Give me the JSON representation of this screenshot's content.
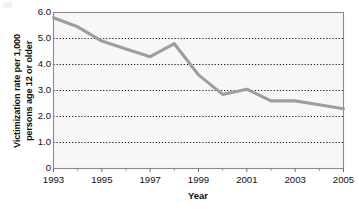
{
  "chart_data": {
    "type": "line",
    "title": "",
    "xlabel": "Year",
    "ylabel_line1": "Victimization rate per 1,000",
    "ylabel_line2": "persons age 12 or older",
    "x": [
      1993,
      1994,
      1995,
      1996,
      1997,
      1998,
      1999,
      2000,
      2001,
      2002,
      2003,
      2004,
      2005
    ],
    "values": [
      5.8,
      5.45,
      4.9,
      4.6,
      4.3,
      4.8,
      3.6,
      2.85,
      3.05,
      2.6,
      2.6,
      2.45,
      2.3
    ],
    "series": [
      {
        "name": "Victimization rate",
        "color": "#9e9e9e",
        "values": [
          5.8,
          5.45,
          4.9,
          4.6,
          4.3,
          4.8,
          3.6,
          2.85,
          3.05,
          2.6,
          2.6,
          2.45,
          2.3
        ]
      }
    ],
    "xlim": [
      1993,
      2005
    ],
    "ylim": [
      0,
      6
    ],
    "xticks": [
      1993,
      1995,
      1997,
      1999,
      2001,
      2003,
      2005
    ],
    "xtick_labels": [
      "1993",
      "1995",
      "1997",
      "1999",
      "2001",
      "2003",
      "2005"
    ],
    "xminor_ticks": [
      1994,
      1996,
      1998,
      2000,
      2002,
      2004
    ],
    "yticks": [
      0,
      1,
      2,
      3,
      4,
      5,
      6
    ],
    "ytick_labels": [
      "0",
      "1.0",
      "2.0",
      "3.0",
      "4.0",
      "5.0",
      "6.0"
    ],
    "grid": true,
    "grid_style": "dotted",
    "grid_color": "#1a1a1a",
    "legend": "none",
    "plot_background": "#f7f7f7",
    "axis_color": "#8c8c8c"
  },
  "axis": {
    "xlabel": "Year",
    "ylabel_line1": "Victimization rate per 1,000",
    "ylabel_line2": "persons age 12 or older"
  }
}
